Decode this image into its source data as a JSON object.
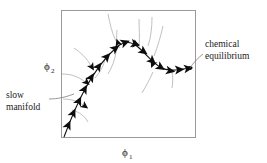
{
  "figure": {
    "type": "phase-plane-diagram",
    "background_color": "#ffffff",
    "frame": {
      "x": 61,
      "y": 10,
      "width": 135,
      "height": 128,
      "stroke_color": "#9a9a9a"
    },
    "axes": {
      "x_label": "ϕ",
      "x_subscript": "1",
      "y_label": "ϕ",
      "y_subscript": "2"
    },
    "annotations": [
      {
        "name": "slow-manifold",
        "line1": "slow",
        "line2": "manifold",
        "text_x": 6,
        "text_y": 98,
        "leader_from_x": 49,
        "leader_from_y": 99,
        "leader_to_x": 74,
        "leader_to_y": 94
      },
      {
        "name": "chemical-equilibrium",
        "line1": "chemical",
        "line2": "equilibrium",
        "text_x": 205,
        "text_y": 48,
        "leader_from_x": 203,
        "leader_from_y": 57,
        "leader_to_x": 190,
        "leader_to_y": 68
      }
    ],
    "manifold_curve": {
      "name": "slow-manifold-curve",
      "color": "#111111",
      "path": "M 64 137 C 70 121, 76 106, 84 91 C 93 74, 104 58, 117 47 C 124 41, 131 41, 138 47 C 146 54, 152 62, 160 67 C 168 72, 178 70, 190 68"
    },
    "manifold_arrows": [
      {
        "x": 66.5,
        "y": 129,
        "angle": -66
      },
      {
        "x": 71.5,
        "y": 117,
        "angle": -66
      },
      {
        "x": 77,
        "y": 105,
        "angle": -64
      },
      {
        "x": 82.5,
        "y": 93,
        "angle": -62
      },
      {
        "x": 89,
        "y": 81,
        "angle": -58
      },
      {
        "x": 96,
        "y": 70,
        "angle": -54
      },
      {
        "x": 104,
        "y": 60,
        "angle": -48
      },
      {
        "x": 112,
        "y": 51,
        "angle": -38
      },
      {
        "x": 121,
        "y": 44,
        "angle": -20
      },
      {
        "x": 131,
        "y": 43,
        "angle": 14
      },
      {
        "x": 140,
        "y": 49,
        "angle": 36
      },
      {
        "x": 149,
        "y": 58,
        "angle": 42
      },
      {
        "x": 157,
        "y": 65,
        "angle": 32
      },
      {
        "x": 166,
        "y": 70,
        "angle": 10
      },
      {
        "x": 175,
        "y": 70,
        "angle": -4
      },
      {
        "x": 184,
        "y": 69,
        "angle": -8
      }
    ],
    "equilibrium_point": {
      "x": 190,
      "y": 68,
      "radius": 2.1
    },
    "trajectory_curves": [
      {
        "name": "traj-top-left-1",
        "path": "M 74 48 C 80 52, 87 58, 91 66"
      },
      {
        "name": "traj-left-1",
        "path": "M 62 74 C 70 74, 78 76, 85 82"
      },
      {
        "name": "traj-left-2",
        "path": "M 63 99 C 71 99, 78 101, 83 105"
      },
      {
        "name": "traj-left-3",
        "path": "M 72 110 C 79 112, 85 116, 88 122"
      },
      {
        "name": "traj-mid-1",
        "path": "M 95 78 C 100 72, 104 66, 105 58"
      },
      {
        "name": "traj-mid-2",
        "path": "M 108 74 C 112 67, 115 60, 116 52"
      },
      {
        "name": "traj-mid-3",
        "path": "M 117 30 C 116 38, 117 44, 120 48"
      },
      {
        "name": "traj-top-1",
        "path": "M 108 14 C 110 24, 112 33, 116 41"
      },
      {
        "name": "traj-top-2",
        "path": "M 139 19 C 139 28, 140 37, 139 45"
      },
      {
        "name": "traj-right-1",
        "path": "M 152 17 C 152 27, 151 37, 148 46"
      },
      {
        "name": "traj-right-2",
        "path": "M 163 26 C 161 35, 158 46, 154 56"
      },
      {
        "name": "traj-right-3",
        "path": "M 142 93 C 146 86, 150 79, 153 72"
      },
      {
        "name": "traj-right-4",
        "path": "M 172 88 C 173 82, 173 77, 172 72"
      }
    ],
    "trajectory_arrows": [
      {
        "x": 90,
        "y": 64,
        "angle": 58
      },
      {
        "x": 84,
        "y": 80,
        "angle": 42
      },
      {
        "x": 82,
        "y": 104,
        "angle": 36
      },
      {
        "x": 119,
        "y": 46,
        "angle": 66
      },
      {
        "x": 115,
        "y": 44,
        "angle": 72
      },
      {
        "x": 154,
        "y": 61,
        "angle": 112
      }
    ]
  }
}
